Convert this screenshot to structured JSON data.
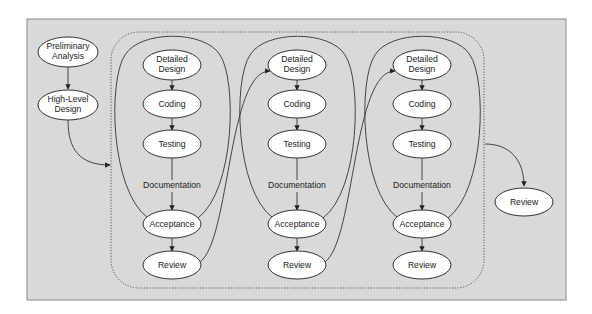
{
  "diagram": {
    "title": "",
    "colors": {
      "panel_fill": "#d9d9d9",
      "node_fill": "#ffffff",
      "stroke": "#333333"
    },
    "prelude": [
      {
        "id": "prelim",
        "line1": "Preliminary",
        "line2": "Analysis"
      },
      {
        "id": "hld",
        "line1": "High-Level",
        "line2": "Design"
      }
    ],
    "iterations": [
      {
        "nodes": [
          {
            "line1": "Detailed",
            "line2": "Design"
          },
          {
            "line1": "Coding",
            "line2": ""
          },
          {
            "line1": "Testing",
            "line2": ""
          },
          {
            "line1": "Acceptance",
            "line2": ""
          },
          {
            "line1": "Review",
            "line2": ""
          }
        ],
        "edge_label": "Documentation"
      },
      {
        "nodes": [
          {
            "line1": "Detailed",
            "line2": "Design"
          },
          {
            "line1": "Coding",
            "line2": ""
          },
          {
            "line1": "Testing",
            "line2": ""
          },
          {
            "line1": "Acceptance",
            "line2": ""
          },
          {
            "line1": "Review",
            "line2": ""
          }
        ],
        "edge_label": "Documentation"
      },
      {
        "nodes": [
          {
            "line1": "Detailed",
            "line2": "Design"
          },
          {
            "line1": "Coding",
            "line2": ""
          },
          {
            "line1": "Testing",
            "line2": ""
          },
          {
            "line1": "Acceptance",
            "line2": ""
          },
          {
            "line1": "Review",
            "line2": ""
          }
        ],
        "edge_label": "Documentation"
      }
    ],
    "final": {
      "line1": "Review"
    }
  }
}
